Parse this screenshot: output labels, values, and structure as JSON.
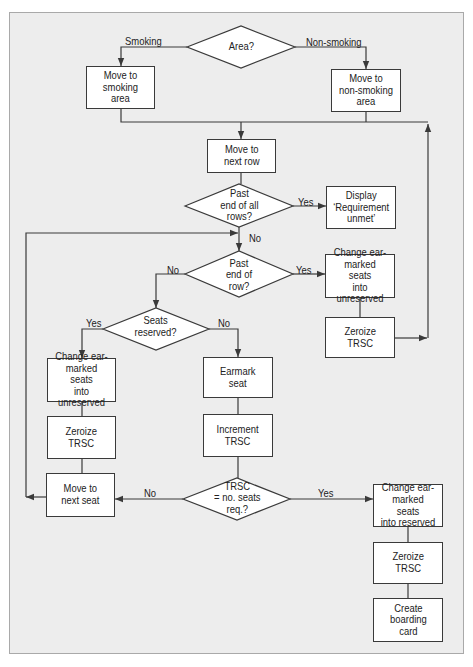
{
  "nodes": {
    "area": "Area?",
    "smoking_area": "Move to\nsmoking\narea",
    "nonsmoking_area": "Move to\nnon-smoking\narea",
    "next_row": "Move to\nnext row",
    "past_all_rows": "Past\nend of all\nrows?",
    "requirement_unmet": "Display\n‘Requirement\nunmet’",
    "past_end_of_row": "Past\nend of\nrow?",
    "unreserve_at_row_end": "Change ear-\nmarked seats\ninto unreserved",
    "zeroize_at_row_end": "Zeroize\nTRSC",
    "seats_reserved": "Seats\nreserved?",
    "unreserve_seat_taken": "Change ear-\nmarked seats\ninto unreserved",
    "zeroize_seat_taken": "Zeroize\nTRSC",
    "earmark_seat": "Earmark\nseat",
    "increment_trsc": "Increment\nTRSC",
    "move_next_seat": "Move to\nnext seat",
    "trsc_equals_required": "TRSC\n= no. seats\nreq.?",
    "reserve_seats": "Change ear-\nmarked seats\ninto reserved",
    "zeroize_final": "Zeroize\nTRSC",
    "boarding_card": "Create\nboarding\ncard"
  },
  "edge_labels": {
    "smoking": "Smoking",
    "non_smoking": "Non-smoking",
    "all_rows_yes": "Yes",
    "all_rows_no": "No",
    "end_row_no": "No",
    "end_row_yes": "Yes",
    "reserved_yes": "Yes",
    "reserved_no": "No",
    "trsc_no": "No",
    "trsc_yes": "Yes"
  },
  "colors": {
    "page_background": "#ffffff",
    "panel_background": "#ededed",
    "panel_border": "#a9a9a9",
    "node_fill": "#ffffff",
    "line": "#3a3a3a",
    "text": "#222222"
  }
}
